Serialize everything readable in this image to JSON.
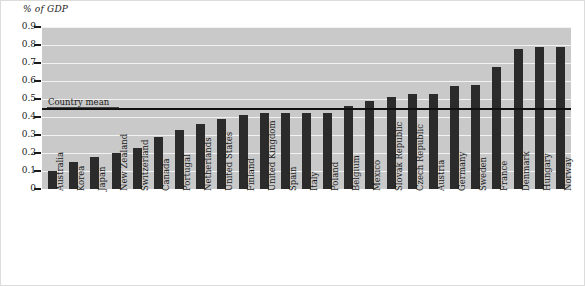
{
  "chart_data": {
    "type": "bar",
    "title": "",
    "subtitle": "",
    "xlabel": "",
    "ylabel": "% of GDP",
    "ylim": [
      0,
      0.9
    ],
    "ytick_labels": [
      "0.9",
      "0.8",
      "0.7",
      "0.6",
      "0.5",
      "0.4",
      "0.3",
      "0.2",
      "0.1",
      "0"
    ],
    "ytick_values": [
      0.9,
      0.8,
      0.7,
      0.6,
      0.5,
      0.4,
      0.3,
      0.2,
      0.1,
      0
    ],
    "grid": true,
    "legend_position": "none",
    "categories": [
      "Australia",
      "Korea",
      "Japan",
      "New Zealand",
      "Switzerland",
      "Canada",
      "Portugal",
      "Netherlands",
      "United States",
      "Finland",
      "United Kingdom",
      "Spain",
      "Italy",
      "Poland",
      "Belgium",
      "Mexico",
      "Slovak Republic",
      "Czech Republic",
      "Austria",
      "Germany",
      "Sweden",
      "France",
      "Denmark",
      "Hungary",
      "Norway"
    ],
    "values": [
      0.1,
      0.15,
      0.18,
      0.2,
      0.23,
      0.29,
      0.33,
      0.36,
      0.39,
      0.41,
      0.42,
      0.42,
      0.42,
      0.42,
      0.46,
      0.49,
      0.51,
      0.53,
      0.53,
      0.57,
      0.58,
      0.68,
      0.78,
      0.79,
      0.79
    ],
    "annotations": [
      {
        "name": "country-mean",
        "label": "Country mean",
        "value": 0.445,
        "type": "horizontal-line"
      }
    ],
    "colors": {
      "bar": "#2b2b2b",
      "plot_background": "#c9c9c9",
      "gridline": "#f2f2f2",
      "mean_line": "#111111",
      "figure_background": "#ffffff",
      "text": "#1a1a1a"
    }
  }
}
